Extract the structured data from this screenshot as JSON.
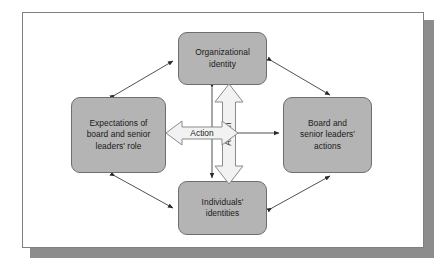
{
  "figure": {
    "type": "cycle-diagram",
    "background_color": "#ffffff",
    "frame_border_color": "#808080",
    "frame_shadow_color": "#8c8c8c",
    "node_fill_color": "#b4b4b4",
    "node_border_color": "#6e6e6e",
    "block_arrow_fill": "#f2f2f2",
    "block_arrow_stroke": "#8a8a8a",
    "connector_color": "#3c3c3c"
  },
  "nodes": {
    "top": {
      "id": "organizational-identity",
      "label": "Organizational\nidentity"
    },
    "left": {
      "id": "expectations-of-board-and-senior-leaders-role",
      "label": "Expectations of\nboard and senior\nleaders' role"
    },
    "right": {
      "id": "board-and-senior-leaders-actions",
      "label": "Board and\nsenior leaders'\nactions"
    },
    "bottom": {
      "id": "individuals-identities",
      "label": "Individuals'\nidentities"
    }
  },
  "block_arrows": {
    "horizontal": {
      "id": "action-arrow-horizontal",
      "label": "Action",
      "direction": "double",
      "orientation": "horizontal",
      "from": "Expectations of board and senior leaders' role",
      "to": "center"
    },
    "vertical": {
      "id": "action-arrow-vertical",
      "label": "Action",
      "direction": "double",
      "orientation": "vertical",
      "from": "Organizational identity",
      "to": "Individuals' identities"
    }
  },
  "connectors": [
    {
      "id": "left-to-top",
      "from": "Expectations of board and senior leaders' role",
      "to": "Organizational identity",
      "direction": "double"
    },
    {
      "id": "top-to-right",
      "from": "Organizational identity",
      "to": "Board and senior leaders' actions",
      "direction": "double"
    },
    {
      "id": "left-to-bottom",
      "from": "Expectations of board and senior leaders' role",
      "to": "Individuals' identities",
      "direction": "double"
    },
    {
      "id": "bottom-to-right",
      "from": "Individuals' identities",
      "to": "Board and senior leaders' actions",
      "direction": "double"
    },
    {
      "id": "top-to-bottom-thin",
      "from": "Organizational identity",
      "to": "Individuals' identities",
      "direction": "double"
    },
    {
      "id": "center-to-right",
      "from": "center",
      "to": "Board and senior leaders' actions",
      "direction": "single"
    }
  ]
}
